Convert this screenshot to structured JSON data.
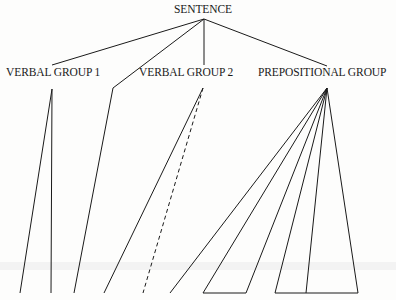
{
  "diagram": {
    "title": "SENTENCE",
    "nodes": [
      {
        "id": "sentence",
        "label": "SENTENCE",
        "x": 174,
        "y": 3
      },
      {
        "id": "vg1",
        "label": "VERBAL GROUP 1",
        "x": 6,
        "y": 66
      },
      {
        "id": "vg2",
        "label": "VERBAL GROUP 2",
        "x": 139,
        "y": 66
      },
      {
        "id": "pg",
        "label": "PREPOSITIONAL GROUP",
        "x": 258,
        "y": 66
      }
    ],
    "colors": {
      "line": "#1a1a1a",
      "background": "#fdfdfc"
    },
    "edges": [
      {
        "from": [
          204,
          19
        ],
        "to": [
          52,
          65
        ],
        "style": "solid"
      },
      {
        "from": [
          204,
          19
        ],
        "to": [
          113,
          88
        ],
        "style": "solid"
      },
      {
        "from": [
          204,
          19
        ],
        "to": [
          204,
          65
        ],
        "style": "solid"
      },
      {
        "from": [
          204,
          19
        ],
        "to": [
          327,
          66
        ],
        "style": "solid"
      },
      {
        "from": [
          113,
          88
        ],
        "to": [
          74,
          293
        ],
        "style": "solid"
      },
      {
        "from": [
          52,
          89
        ],
        "to": [
          20,
          293
        ],
        "style": "solid"
      },
      {
        "from": [
          52,
          89
        ],
        "to": [
          51,
          293
        ],
        "style": "solid"
      },
      {
        "from": [
          203,
          88
        ],
        "to": [
          104,
          293
        ],
        "style": "solid"
      },
      {
        "from": [
          203,
          88
        ],
        "to": [
          143,
          293
        ],
        "style": "dashed"
      },
      {
        "from": [
          327,
          88
        ],
        "to": [
          170,
          293
        ],
        "style": "solid"
      },
      {
        "from": [
          327,
          88
        ],
        "to": [
          203,
          293
        ],
        "style": "solid"
      },
      {
        "from": [
          327,
          88
        ],
        "to": [
          246,
          293
        ],
        "style": "solid"
      },
      {
        "from": [
          327,
          88
        ],
        "to": [
          275,
          293
        ],
        "style": "solid"
      },
      {
        "from": [
          327,
          88
        ],
        "to": [
          306,
          293
        ],
        "style": "solid"
      },
      {
        "from": [
          327,
          88
        ],
        "to": [
          358,
          293
        ],
        "style": "solid"
      },
      {
        "from": [
          203,
          293
        ],
        "to": [
          246,
          293
        ],
        "style": "solid"
      },
      {
        "from": [
          275,
          293
        ],
        "to": [
          358,
          293
        ],
        "style": "solid"
      }
    ]
  }
}
